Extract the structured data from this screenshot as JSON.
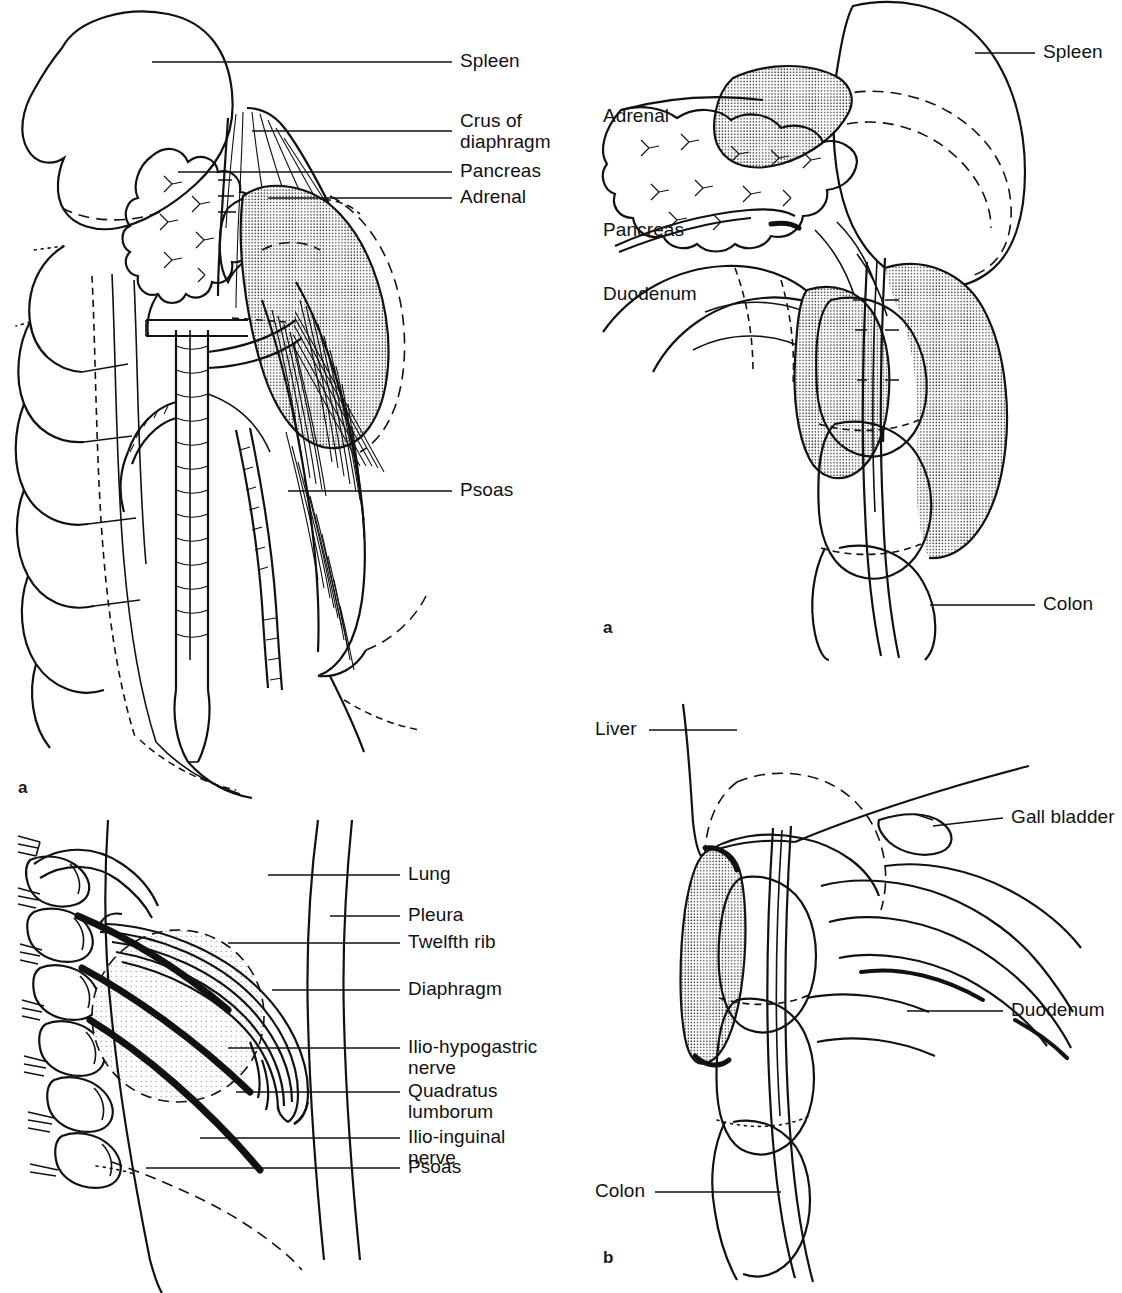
{
  "figure": {
    "ink_color": "#111111",
    "background_color": "#ffffff"
  },
  "panels": [
    {
      "id": "top-left",
      "letter": "a",
      "labels": [
        {
          "text": "Spleen"
        },
        {
          "text": "Crus of\ndiaphragm"
        },
        {
          "text": "Pancreas"
        },
        {
          "text": "Adrenal"
        },
        {
          "text": "Psoas"
        }
      ]
    },
    {
      "id": "top-right",
      "letter": "a",
      "labels": [
        {
          "text": "Adrenal"
        },
        {
          "text": "Pancreas"
        },
        {
          "text": "Duodenum"
        },
        {
          "text": "Spleen"
        },
        {
          "text": "Colon"
        }
      ]
    },
    {
      "id": "bottom-left",
      "letter": "b",
      "labels": [
        {
          "text": "Lung"
        },
        {
          "text": "Pleura"
        },
        {
          "text": "Twelfth rib"
        },
        {
          "text": "Diaphragm"
        },
        {
          "text": "Ilio-hypogastric\nnerve"
        },
        {
          "text": "Quadratus\nlumborum"
        },
        {
          "text": "Ilio-inguinal\nnerve"
        },
        {
          "text": "Psoas"
        }
      ]
    },
    {
      "id": "bottom-right",
      "letter": "b",
      "labels": [
        {
          "text": "Liver"
        },
        {
          "text": "Gall bladder"
        },
        {
          "text": "Duodenum"
        },
        {
          "text": "Colon"
        }
      ]
    }
  ]
}
